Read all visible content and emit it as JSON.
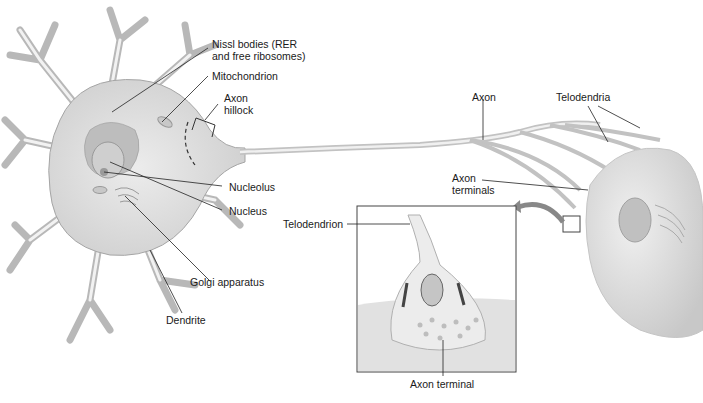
{
  "labels": {
    "nissl": "Nissl bodies (RER",
    "nissl2": "and free ribosomes)",
    "mitochondrion": "Mitochondrion",
    "axon_hillock_1": "Axon",
    "axon_hillock_2": "hillock",
    "axon": "Axon",
    "telodendria": "Telodendria",
    "axon_terminals_1": "Axon",
    "axon_terminals_2": "terminals",
    "nucleolus": "Nucleolus",
    "nucleus": "Nucleus",
    "golgi": "Golgi apparatus",
    "dendrite": "Dendrite",
    "telodendrion": "Telodendrion",
    "axon_terminal": "Axon terminal"
  },
  "colors": {
    "cell_fill": "#e4e4e4",
    "cell_stroke": "#9a9a9a",
    "leader_line": "#222222",
    "inset_border": "#555555"
  }
}
